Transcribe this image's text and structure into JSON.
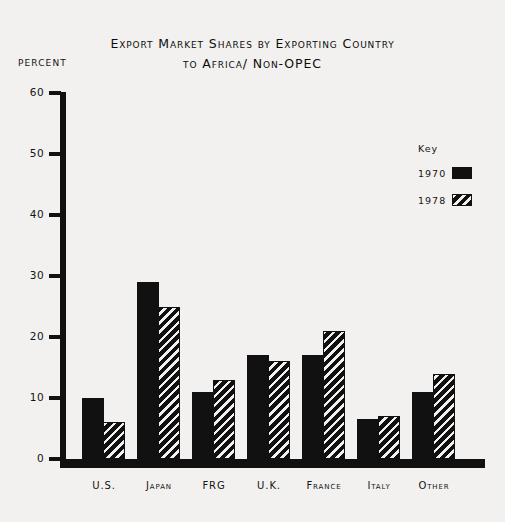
{
  "axis_label": "PERCENT",
  "legend": {
    "title": "Key",
    "entries": [
      {
        "label": "1970",
        "style": "solid"
      },
      {
        "label": "1978",
        "style": "hatch"
      }
    ]
  },
  "chart_data": {
    "type": "bar",
    "title": "Export Market Shares by Exporting Country",
    "subtitle": "to Africa/ Non-OPEC",
    "xlabel": "",
    "ylabel": "PERCENT",
    "ylim": [
      0,
      60
    ],
    "yticks": [
      0,
      10,
      20,
      30,
      40,
      50,
      60
    ],
    "ytick_labels": [
      "0",
      "10",
      "20",
      "30",
      "40",
      "50",
      "60"
    ],
    "grid": false,
    "legend_position": "right",
    "categories": [
      "U.S.",
      "Japan",
      "FRG",
      "U.K.",
      "France",
      "Italy",
      "Other"
    ],
    "series": [
      {
        "name": "1970",
        "values": [
          10,
          29,
          11,
          17,
          17,
          6.5,
          11
        ]
      },
      {
        "name": "1978",
        "values": [
          6,
          25,
          13,
          16,
          21,
          7,
          14
        ]
      }
    ]
  }
}
